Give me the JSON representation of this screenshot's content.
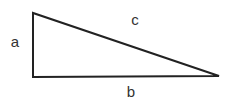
{
  "diagram": {
    "type": "right-triangle",
    "stroke_color": "#222222",
    "stroke_width": 2,
    "fill": "#ffffff",
    "vertices": {
      "top_left": [
        33,
        13
      ],
      "bottom_left": [
        33,
        77
      ],
      "bottom_right": [
        219,
        76
      ]
    },
    "labels": {
      "a": {
        "text": "a",
        "x": 15,
        "y": 41
      },
      "b": {
        "text": "b",
        "x": 131,
        "y": 91
      },
      "c": {
        "text": "c",
        "x": 135,
        "y": 19
      }
    }
  }
}
